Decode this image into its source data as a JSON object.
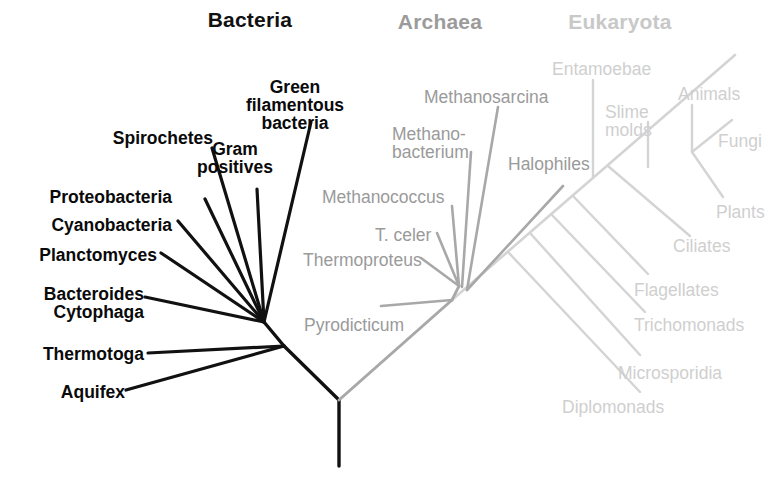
{
  "figure": {
    "kind": "unrooted-phylogenetic-tree",
    "background": "#ffffff"
  },
  "colors": {
    "bacteria_text": "#0a0a0a",
    "bacteria_line": "#111111",
    "archaea_text": "#9a9a9a",
    "archaea_line": "#a8a8a8",
    "eukaryota_text": "#cfcfcf",
    "eukaryota_line": "#d4d4d4",
    "root_line": "#111111"
  },
  "domains": [
    {
      "id": "bacteria",
      "title": "Bacteria",
      "title_color": "#111111",
      "x": 150,
      "y": 8,
      "width": 200,
      "align": "center"
    },
    {
      "id": "archaea",
      "title": "Archaea",
      "title_color": "#9b9b9b",
      "x": 350,
      "y": 10,
      "width": 180,
      "align": "center"
    },
    {
      "id": "eukaryota",
      "title": "Eukaryota",
      "title_color": "#c8c8c8",
      "x": 520,
      "y": 10,
      "width": 200,
      "align": "center"
    }
  ],
  "taxa": {
    "bacteria": [
      {
        "id": "green-filamentous-bacteria",
        "label": "Green\nfilamentous\nbacteria",
        "x": 230,
        "y": 78,
        "width": 130,
        "align": "center"
      },
      {
        "id": "spirochetes",
        "label": "Spirochetes",
        "x": 88,
        "y": 129,
        "width": 125,
        "align": "right"
      },
      {
        "id": "gram-positives",
        "label": "Gram\npositives",
        "x": 196,
        "y": 140,
        "width": 78,
        "align": "center"
      },
      {
        "id": "proteobacteria",
        "label": "Proteobacteria",
        "x": 20,
        "y": 188,
        "width": 152,
        "align": "right"
      },
      {
        "id": "cyanobacteria",
        "label": "Cyanobacteria",
        "x": 23,
        "y": 216,
        "width": 149,
        "align": "right"
      },
      {
        "id": "planctomyces",
        "label": "Planctomyces",
        "x": 22,
        "y": 246,
        "width": 135,
        "align": "right"
      },
      {
        "id": "bacteroides-cytophaga",
        "label": "Bacteroides\nCytophaga",
        "x": 14,
        "y": 285,
        "width": 130,
        "align": "right"
      },
      {
        "id": "thermotoga",
        "label": "Thermotoga",
        "x": 16,
        "y": 345,
        "width": 128,
        "align": "right"
      },
      {
        "id": "aquifex",
        "label": "Aquifex",
        "x": 30,
        "y": 383,
        "width": 95,
        "align": "right"
      }
    ],
    "archaea": [
      {
        "id": "methanosarcina",
        "label": "Methanosarcina",
        "x": 424,
        "y": 88,
        "width": 160,
        "align": "left"
      },
      {
        "id": "methanobacterium",
        "label": "Methano-\nbacterium",
        "x": 392,
        "y": 125,
        "width": 100,
        "align": "left"
      },
      {
        "id": "halophiles",
        "label": "Halophiles",
        "x": 508,
        "y": 155,
        "width": 105,
        "align": "left"
      },
      {
        "id": "methanococcus",
        "label": "Methanococcus",
        "x": 322,
        "y": 188,
        "width": 160,
        "align": "left"
      },
      {
        "id": "t-celer",
        "label": "T. celer",
        "x": 375,
        "y": 226,
        "width": 85,
        "align": "left"
      },
      {
        "id": "thermoproteus",
        "label": "Thermoproteus",
        "x": 303,
        "y": 251,
        "width": 148,
        "align": "left"
      },
      {
        "id": "pyrodicticum",
        "label": "Pyrodicticum",
        "x": 304,
        "y": 316,
        "width": 135,
        "align": "left"
      }
    ],
    "eukaryota": [
      {
        "id": "entamoebae",
        "label": "Entamoebae",
        "x": 552,
        "y": 60,
        "width": 130,
        "align": "left"
      },
      {
        "id": "animals",
        "label": "Animals",
        "x": 678,
        "y": 85,
        "width": 88,
        "align": "left"
      },
      {
        "id": "slime-molds",
        "label": "Slime\nmolds",
        "x": 605,
        "y": 103,
        "width": 70,
        "align": "left"
      },
      {
        "id": "fungi",
        "label": "Fungi",
        "x": 718,
        "y": 132,
        "width": 62,
        "align": "left"
      },
      {
        "id": "plants",
        "label": "Plants",
        "x": 716,
        "y": 203,
        "width": 66,
        "align": "left"
      },
      {
        "id": "ciliates",
        "label": "Ciliates",
        "x": 673,
        "y": 237,
        "width": 80,
        "align": "left"
      },
      {
        "id": "flagellates",
        "label": "Flagellates",
        "x": 634,
        "y": 281,
        "width": 112,
        "align": "left"
      },
      {
        "id": "trichomonads",
        "label": "Trichomonads",
        "x": 634,
        "y": 316,
        "width": 140,
        "align": "left"
      },
      {
        "id": "microsporidia",
        "label": "Microsporidia",
        "x": 618,
        "y": 364,
        "width": 138,
        "align": "left"
      },
      {
        "id": "diplomonads",
        "label": "Diplomonads",
        "x": 562,
        "y": 398,
        "width": 136,
        "align": "left"
      }
    ]
  },
  "branches": {
    "root": [
      {
        "id": "root-stem",
        "x1": 339,
        "y1": 400,
        "x2": 339,
        "y2": 466,
        "color": "#111111",
        "width": 3.4
      },
      {
        "id": "root-to-bacteria",
        "x1": 339,
        "y1": 400,
        "x2": 284,
        "y2": 346,
        "color": "#111111",
        "width": 3.4
      },
      {
        "id": "root-to-archaea-eukaryota",
        "x1": 339,
        "y1": 400,
        "x2": 452,
        "y2": 300,
        "color": "#a8a8a8",
        "width": 3.0
      }
    ],
    "bacteria": [
      {
        "id": "bact-node-link",
        "x1": 284,
        "y1": 346,
        "x2": 264,
        "y2": 322,
        "color": "#111111",
        "width": 3.4
      },
      {
        "id": "br-aquifex",
        "x1": 284,
        "y1": 346,
        "x2": 126,
        "y2": 390,
        "color": "#111111",
        "width": 3.2
      },
      {
        "id": "br-thermotoga",
        "x1": 284,
        "y1": 346,
        "x2": 148,
        "y2": 353,
        "color": "#111111",
        "width": 3.2
      },
      {
        "id": "br-bacteroides",
        "x1": 264,
        "y1": 322,
        "x2": 145,
        "y2": 297,
        "color": "#111111",
        "width": 3.2
      },
      {
        "id": "br-planctomyces",
        "x1": 264,
        "y1": 322,
        "x2": 161,
        "y2": 253,
        "color": "#111111",
        "width": 3.2
      },
      {
        "id": "br-cyanobacteria",
        "x1": 264,
        "y1": 322,
        "x2": 178,
        "y2": 221,
        "color": "#111111",
        "width": 3.2
      },
      {
        "id": "br-proteobacteria",
        "x1": 264,
        "y1": 322,
        "x2": 205,
        "y2": 199,
        "color": "#111111",
        "width": 3.2
      },
      {
        "id": "br-spirochetes",
        "x1": 264,
        "y1": 322,
        "x2": 212,
        "y2": 148,
        "color": "#111111",
        "width": 3.2
      },
      {
        "id": "br-gram-positives",
        "x1": 264,
        "y1": 322,
        "x2": 257,
        "y2": 189,
        "color": "#111111",
        "width": 3.2
      },
      {
        "id": "br-green-filamentous",
        "x1": 264,
        "y1": 322,
        "x2": 311,
        "y2": 122,
        "color": "#111111",
        "width": 3.2
      }
    ],
    "archaea": [
      {
        "id": "arch-node-link",
        "x1": 452,
        "y1": 300,
        "x2": 459,
        "y2": 286,
        "color": "#a8a8a8",
        "width": 2.8
      },
      {
        "id": "br-pyrodicticum",
        "x1": 452,
        "y1": 300,
        "x2": 381,
        "y2": 306,
        "color": "#a8a8a8",
        "width": 2.6
      },
      {
        "id": "br-thermoproteus",
        "x1": 459,
        "y1": 286,
        "x2": 421,
        "y2": 258,
        "color": "#a8a8a8",
        "width": 2.6
      },
      {
        "id": "br-t-celer",
        "x1": 459,
        "y1": 286,
        "x2": 437,
        "y2": 233,
        "color": "#a8a8a8",
        "width": 2.6
      },
      {
        "id": "br-methanococcus",
        "x1": 459,
        "y1": 286,
        "x2": 452,
        "y2": 206,
        "color": "#a8a8a8",
        "width": 2.6
      },
      {
        "id": "br-methanobacterium",
        "x1": 462,
        "y1": 287,
        "x2": 471,
        "y2": 152,
        "color": "#a8a8a8",
        "width": 2.6
      },
      {
        "id": "br-methanosarcina",
        "x1": 467,
        "y1": 290,
        "x2": 498,
        "y2": 107,
        "color": "#a8a8a8",
        "width": 2.6
      },
      {
        "id": "br-halophiles",
        "x1": 467,
        "y1": 290,
        "x2": 563,
        "y2": 186,
        "color": "#a8a8a8",
        "width": 2.6
      }
    ],
    "eukaryota": [
      {
        "id": "euk-backbone",
        "x1": 452,
        "y1": 300,
        "x2": 735,
        "y2": 55,
        "color": "#d4d4d4",
        "width": 2.6
      },
      {
        "id": "br-diplomonads",
        "x1": 508,
        "y1": 252,
        "x2": 640,
        "y2": 392,
        "color": "#d4d4d4",
        "width": 2.4
      },
      {
        "id": "br-microsporidia",
        "x1": 530,
        "y1": 233,
        "x2": 640,
        "y2": 355,
        "color": "#d4d4d4",
        "width": 2.4
      },
      {
        "id": "br-trichomonads",
        "x1": 551,
        "y1": 214,
        "x2": 645,
        "y2": 312,
        "color": "#d4d4d4",
        "width": 2.4
      },
      {
        "id": "br-flagellates",
        "x1": 573,
        "y1": 196,
        "x2": 648,
        "y2": 274,
        "color": "#d4d4d4",
        "width": 2.4
      },
      {
        "id": "br-ciliates",
        "x1": 608,
        "y1": 166,
        "x2": 690,
        "y2": 236,
        "color": "#d4d4d4",
        "width": 2.4
      },
      {
        "id": "br-entamoebae",
        "x1": 593,
        "y1": 178,
        "x2": 593,
        "y2": 80,
        "color": "#d4d4d4",
        "width": 2.4
      },
      {
        "id": "br-slime-molds",
        "x1": 648,
        "y1": 122,
        "x2": 648,
        "y2": 167,
        "color": "#d4d4d4",
        "width": 2.4
      },
      {
        "id": "br-animals",
        "x1": 692,
        "y1": 152,
        "x2": 692,
        "y2": 105,
        "color": "#d4d4d4",
        "width": 2.4
      },
      {
        "id": "br-fungi",
        "x1": 692,
        "y1": 152,
        "x2": 732,
        "y2": 120,
        "color": "#d4d4d4",
        "width": 2.4
      },
      {
        "id": "br-plants",
        "x1": 692,
        "y1": 152,
        "x2": 723,
        "y2": 197,
        "color": "#d4d4d4",
        "width": 2.4
      }
    ]
  }
}
